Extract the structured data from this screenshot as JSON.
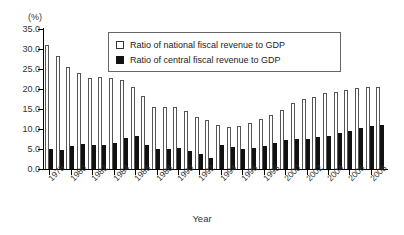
{
  "chart_data": {
    "type": "bar",
    "title": "",
    "subtitle": "",
    "xlabel": "Year",
    "ylabel": "",
    "unit_label": "(%)",
    "ylim": [
      0.0,
      35.0
    ],
    "ytick_step": 5.0,
    "yticks": [
      "35.0",
      "30.0",
      "25.0",
      "20.0",
      "15.0",
      "10.0",
      "5.0",
      "0.0"
    ],
    "ytick_values": [
      35.0,
      30.0,
      25.0,
      20.0,
      15.0,
      10.0,
      5.0,
      0.0
    ],
    "grid": false,
    "legend_position": "top-center",
    "categories": [
      "1978",
      "1979",
      "1980",
      "1981",
      "1982",
      "1983",
      "1984",
      "1985",
      "1986",
      "1987",
      "1988",
      "1989",
      "1990",
      "1991",
      "1992",
      "1993",
      "1994",
      "1995",
      "1996",
      "1997",
      "1998",
      "1999",
      "2000",
      "2001",
      "2002",
      "2003",
      "2004",
      "2005",
      "2006",
      "2007",
      "2008",
      "2009"
    ],
    "xtick_labels": [
      "1978",
      "1980",
      "1982",
      "1984",
      "1986",
      "1988",
      "1990",
      "1992",
      "1994",
      "1996",
      "1998",
      "2000",
      "2002",
      "2004",
      "2006",
      "2008"
    ],
    "series": [
      {
        "name": "Ratio of national fiscal revenue to GDP",
        "style": "hollow",
        "color": "#ffffff",
        "edge_color": "#555555",
        "values": [
          31.1,
          28.3,
          25.4,
          24.0,
          22.8,
          22.9,
          22.8,
          22.3,
          20.6,
          18.2,
          15.6,
          15.6,
          15.5,
          14.4,
          12.9,
          12.3,
          11.1,
          10.4,
          10.8,
          11.4,
          12.4,
          13.5,
          14.7,
          16.5,
          17.5,
          18.1,
          18.9,
          19.3,
          19.7,
          20.2,
          20.4,
          20.4
        ]
      },
      {
        "name": "Ratio of central fiscal revenue to GDP",
        "style": "filled",
        "color": "#111111",
        "edge_color": "#111111",
        "values": [
          5.1,
          4.8,
          5.7,
          6.3,
          5.9,
          6.1,
          6.6,
          7.8,
          8.2,
          6.0,
          5.1,
          4.9,
          5.2,
          4.4,
          3.8,
          2.7,
          6.0,
          5.4,
          5.1,
          5.3,
          5.7,
          6.5,
          7.3,
          7.5,
          7.6,
          7.9,
          8.2,
          9.0,
          9.6,
          10.3,
          10.7,
          11.0
        ]
      }
    ]
  },
  "legend": {
    "items": [
      {
        "label": "Ratio  of national fiscal revenue to GDP",
        "swatch": "hollow-square-icon"
      },
      {
        "label": "Ratio of central fiscal revenue to GDP",
        "swatch": "filled-square-icon"
      }
    ]
  },
  "axis": {
    "unit": "(%)",
    "x_title": "Year"
  }
}
